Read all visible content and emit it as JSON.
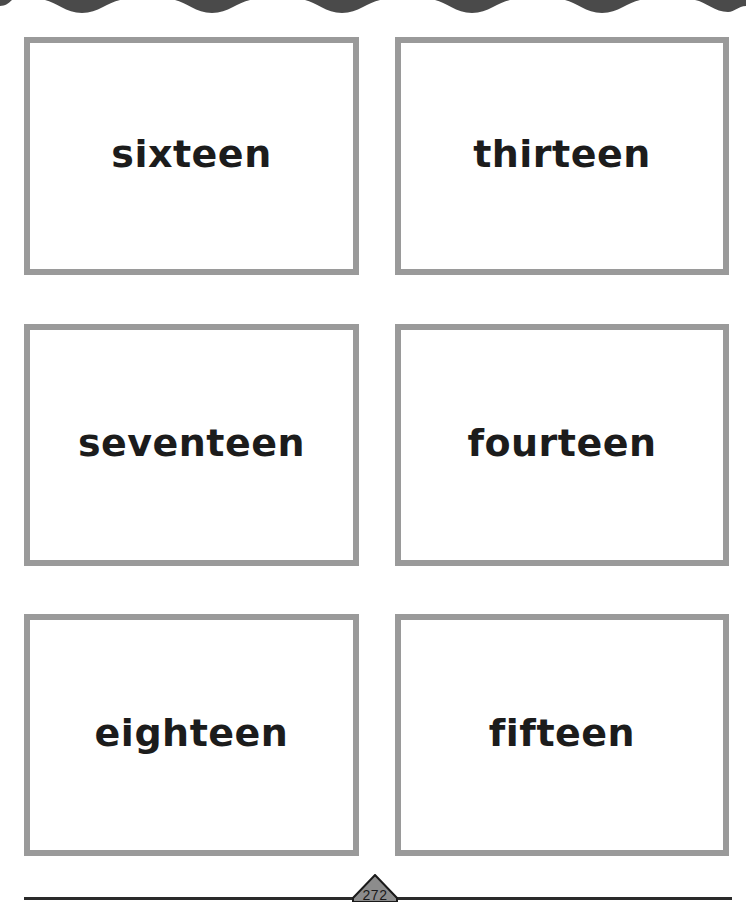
{
  "page": {
    "type": "flash-card worksheet",
    "page_number": "272",
    "colors": {
      "card_border": "#9a9a9a",
      "text": "#1c1c1c",
      "top_wave": "#4a4a4a",
      "badge_fill": "#8c8c8c",
      "rule": "#2a2a2a"
    }
  },
  "cards": [
    {
      "word": "sixteen",
      "row": 1,
      "column": 1
    },
    {
      "word": "thirteen",
      "row": 1,
      "column": 2
    },
    {
      "word": "seventeen",
      "row": 2,
      "column": 1
    },
    {
      "word": "fourteen",
      "row": 2,
      "column": 2
    },
    {
      "word": "eighteen",
      "row": 3,
      "column": 1
    },
    {
      "word": "fifteen",
      "row": 3,
      "column": 2
    }
  ],
  "decorations": {
    "top_border": "scalloped-wave-border",
    "page_badge": "diamond-page-number-badge"
  }
}
